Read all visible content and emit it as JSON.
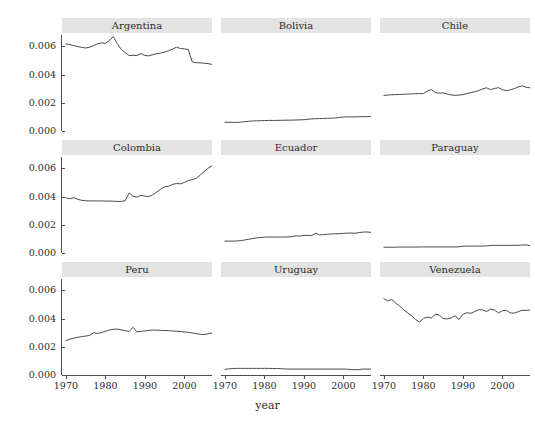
{
  "chart_data": {
    "type": "line",
    "title": "",
    "xlabel": "year",
    "ylabel": "country_power",
    "xlim": [
      1969,
      2007
    ],
    "ylim": [
      0.0,
      0.0068
    ],
    "grid": false,
    "legend": "none",
    "facet_layout": "3x3",
    "x_ticks": [
      1970,
      1980,
      1990,
      2000
    ],
    "x_tick_labels": [
      "1970",
      "1980",
      "1990",
      "2000"
    ],
    "y_ticks": [
      0.0,
      0.002,
      0.004,
      0.006
    ],
    "y_tick_labels": [
      "0.000",
      "0.002",
      "0.004",
      "0.006"
    ],
    "line_color": "#4a4a4a",
    "strip_color": "#e3e3e3",
    "panel_color": "#ffffff",
    "x": [
      1970,
      1971,
      1972,
      1973,
      1974,
      1975,
      1976,
      1977,
      1978,
      1979,
      1980,
      1981,
      1982,
      1983,
      1984,
      1985,
      1986,
      1987,
      1988,
      1989,
      1990,
      1991,
      1992,
      1993,
      1994,
      1995,
      1996,
      1997,
      1998,
      1999,
      2000,
      2001,
      2002,
      2003,
      2004,
      2005,
      2006,
      2007
    ],
    "series": [
      {
        "name": "Argentina",
        "values": [
          0.00617,
          0.00612,
          0.00605,
          0.00598,
          0.00592,
          0.00588,
          0.00593,
          0.00605,
          0.00617,
          0.00624,
          0.00621,
          0.00641,
          0.00668,
          0.0062,
          0.00578,
          0.00556,
          0.00534,
          0.00536,
          0.00535,
          0.00549,
          0.00535,
          0.00532,
          0.0054,
          0.00548,
          0.00552,
          0.0056,
          0.00568,
          0.0058,
          0.00594,
          0.00584,
          0.00582,
          0.00577,
          0.00489,
          0.00483,
          0.00483,
          0.0048,
          0.00477,
          0.00472
        ]
      },
      {
        "name": "Bolivia",
        "values": [
          0.00062,
          0.00062,
          0.00061,
          0.00061,
          0.00063,
          0.00066,
          0.00069,
          0.00071,
          0.00072,
          0.00073,
          0.00074,
          0.00075,
          0.00075,
          0.00075,
          0.00076,
          0.00076,
          0.00077,
          0.00077,
          0.00078,
          0.00079,
          0.0008,
          0.00083,
          0.00086,
          0.00087,
          0.00088,
          0.00089,
          0.0009,
          0.00091,
          0.00092,
          0.00096,
          0.00099,
          0.001,
          0.001,
          0.001,
          0.00101,
          0.00101,
          0.00102,
          0.00102
        ]
      },
      {
        "name": "Chile",
        "values": [
          0.00252,
          0.00255,
          0.00257,
          0.00258,
          0.00259,
          0.0026,
          0.00261,
          0.00263,
          0.00264,
          0.00265,
          0.00265,
          0.00283,
          0.00294,
          0.00272,
          0.00268,
          0.0027,
          0.00262,
          0.00255,
          0.00253,
          0.00254,
          0.00258,
          0.00265,
          0.00272,
          0.00278,
          0.00286,
          0.00298,
          0.00306,
          0.00293,
          0.00301,
          0.00307,
          0.00293,
          0.00285,
          0.00292,
          0.003,
          0.00312,
          0.0032,
          0.0031,
          0.00306
        ]
      },
      {
        "name": "Colombia",
        "values": [
          0.0039,
          0.00384,
          0.00392,
          0.0038,
          0.00373,
          0.0037,
          0.00369,
          0.00369,
          0.00369,
          0.00369,
          0.00368,
          0.00368,
          0.00367,
          0.00365,
          0.00366,
          0.0037,
          0.00425,
          0.00402,
          0.00396,
          0.00408,
          0.00403,
          0.004,
          0.00412,
          0.00432,
          0.00452,
          0.00468,
          0.00473,
          0.00486,
          0.00492,
          0.0049,
          0.005,
          0.00513,
          0.0052,
          0.00529,
          0.00552,
          0.00577,
          0.006,
          0.00618
        ]
      },
      {
        "name": "Ecuador",
        "values": [
          0.00084,
          0.00084,
          0.00084,
          0.00085,
          0.00088,
          0.00092,
          0.00097,
          0.00102,
          0.00107,
          0.0011,
          0.00112,
          0.00113,
          0.00113,
          0.00113,
          0.00113,
          0.00113,
          0.00114,
          0.00116,
          0.00122,
          0.0012,
          0.00124,
          0.00125,
          0.00123,
          0.0014,
          0.00128,
          0.0013,
          0.00133,
          0.00135,
          0.00136,
          0.00137,
          0.00139,
          0.00141,
          0.00141,
          0.0014,
          0.00145,
          0.00148,
          0.00149,
          0.00146
        ]
      },
      {
        "name": "Paraguay",
        "values": [
          0.00041,
          0.00041,
          0.00041,
          0.00041,
          0.00042,
          0.00042,
          0.00042,
          0.00042,
          0.00042,
          0.00043,
          0.00043,
          0.00043,
          0.00043,
          0.00043,
          0.00043,
          0.00043,
          0.00043,
          0.00043,
          0.00043,
          0.00044,
          0.00048,
          0.00049,
          0.00049,
          0.00049,
          0.00049,
          0.00049,
          0.0005,
          0.00053,
          0.00054,
          0.00054,
          0.00054,
          0.00054,
          0.00054,
          0.00054,
          0.00055,
          0.00056,
          0.00058,
          0.00052
        ]
      },
      {
        "name": "Peru",
        "values": [
          0.00243,
          0.00254,
          0.00261,
          0.00267,
          0.00272,
          0.00276,
          0.0028,
          0.003,
          0.00294,
          0.003,
          0.0031,
          0.00318,
          0.00324,
          0.00325,
          0.0032,
          0.00314,
          0.00308,
          0.00338,
          0.00305,
          0.00309,
          0.00312,
          0.00316,
          0.00318,
          0.00318,
          0.00316,
          0.00315,
          0.00314,
          0.00312,
          0.0031,
          0.00308,
          0.00305,
          0.00302,
          0.00298,
          0.00293,
          0.00288,
          0.00287,
          0.00291,
          0.00299
        ]
      },
      {
        "name": "Uruguay",
        "values": [
          0.0004,
          0.00043,
          0.00046,
          0.00047,
          0.00047,
          0.00047,
          0.00047,
          0.00047,
          0.00047,
          0.00047,
          0.00047,
          0.00047,
          0.00046,
          0.00046,
          0.00045,
          0.00043,
          0.00042,
          0.00042,
          0.00042,
          0.00042,
          0.00042,
          0.00042,
          0.00042,
          0.00042,
          0.00042,
          0.00042,
          0.00042,
          0.00042,
          0.00042,
          0.00042,
          0.00042,
          0.00041,
          0.00038,
          0.00037,
          0.00039,
          0.00042,
          0.00042,
          0.00042
        ]
      },
      {
        "name": "Venezuela",
        "values": [
          0.0054,
          0.00525,
          0.00535,
          0.00508,
          0.00488,
          0.00462,
          0.0044,
          0.0042,
          0.00393,
          0.00375,
          0.004,
          0.0041,
          0.00404,
          0.0043,
          0.00424,
          0.004,
          0.00397,
          0.00404,
          0.0042,
          0.00393,
          0.0043,
          0.00441,
          0.00437,
          0.0045,
          0.00462,
          0.00461,
          0.0045,
          0.00466,
          0.0046,
          0.0044,
          0.00455,
          0.00458,
          0.0044,
          0.00438,
          0.00448,
          0.00458,
          0.00458,
          0.0046
        ]
      }
    ]
  },
  "axes": {
    "y_title": "country_power",
    "x_title": "year"
  },
  "facets": [
    [
      {
        "label": "Argentina",
        "series_index": 0
      },
      {
        "label": "Bolivia",
        "series_index": 1
      },
      {
        "label": "Chile",
        "series_index": 2
      }
    ],
    [
      {
        "label": "Colombia",
        "series_index": 3
      },
      {
        "label": "Ecuador",
        "series_index": 4
      },
      {
        "label": "Paraguay",
        "series_index": 5
      }
    ],
    [
      {
        "label": "Peru",
        "series_index": 6
      },
      {
        "label": "Uruguay",
        "series_index": 7
      },
      {
        "label": "Venezuela",
        "series_index": 8
      }
    ]
  ]
}
